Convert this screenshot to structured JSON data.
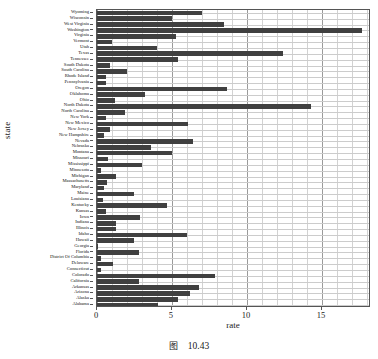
{
  "caption": {
    "symbol": "图",
    "number": "10.43"
  },
  "chart_data": {
    "type": "bar",
    "orientation": "horizontal",
    "title": "",
    "xlabel": "rate",
    "ylabel": "state",
    "xlim": [
      0,
      18.27
    ],
    "xticks": [
      0,
      5,
      10,
      15
    ],
    "xtick_labels": [
      "0",
      "5",
      "10",
      "15"
    ],
    "grid": "both",
    "legend": "none",
    "bar_color": "#404040",
    "categories": [
      "Wyoming",
      "Wisconsin",
      "West Virginia",
      "Washington",
      "Virginia",
      "Vermont",
      "Utah",
      "Texas",
      "Tennessee",
      "South Dakota",
      "South Carolina",
      "Rhode Island",
      "Pennsylvania",
      "Oregon",
      "Oklahoma",
      "Ohio",
      "North Dakota",
      "North Carolina",
      "New York",
      "New Mexico",
      "New Jersey",
      "New Hampshire",
      "Nevada",
      "Nebraska",
      "Montana",
      "Missouri",
      "Mississippi",
      "Minnesota",
      "Michigan",
      "Massachusetts",
      "Maryland",
      "Maine",
      "Louisiana",
      "Kentucky",
      "Kansas",
      "Iowa",
      "Indiana",
      "Illinois",
      "Idaho",
      "Hawaii",
      "Georgia",
      "Florida",
      "District Of Columbia",
      "Delaware",
      "Connecticut",
      "Colorado",
      "California",
      "Arkansas",
      "Arizona",
      "Alaska",
      "Alabama"
    ],
    "values": [
      7.0,
      5.0,
      8.5,
      17.7,
      5.3,
      1.0,
      4.0,
      12.4,
      5.4,
      0.9,
      2.0,
      0.6,
      0.6,
      8.7,
      3.2,
      1.2,
      14.3,
      1.9,
      0.6,
      6.1,
      0.9,
      0.45,
      6.4,
      3.6,
      5.0,
      0.75,
      3.0,
      0.3,
      1.3,
      0.7,
      0.45,
      2.5,
      0.4,
      4.7,
      0.6,
      2.9,
      1.3,
      1.25,
      6.0,
      2.5,
      0.1,
      2.8,
      0.3,
      1.1,
      0.3,
      7.9,
      2.8,
      6.8,
      6.2,
      5.4,
      4.1
    ]
  }
}
